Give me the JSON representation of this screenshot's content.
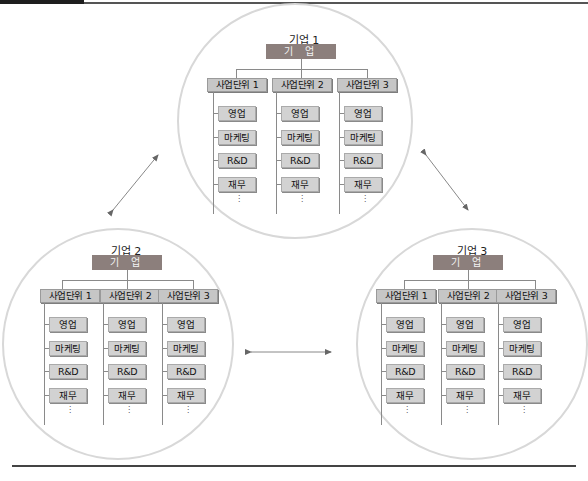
{
  "header": {
    "rule": true
  },
  "companies": [
    {
      "title": "기업 1",
      "corp_label": "기 업",
      "units": [
        {
          "label": "사업단위 1",
          "functions": [
            "영업",
            "마케팅",
            "R&D",
            "재무"
          ],
          "more": "⋮"
        },
        {
          "label": "사업단위 2",
          "functions": [
            "영업",
            "마케팅",
            "R&D",
            "재무"
          ],
          "more": "⋮"
        },
        {
          "label": "사업단위 3",
          "functions": [
            "영업",
            "마케팅",
            "R&D",
            "재무"
          ],
          "more": "⋮"
        }
      ]
    },
    {
      "title": "기업 2",
      "corp_label": "기 업",
      "units": [
        {
          "label": "사업단위 1",
          "functions": [
            "영업",
            "마케팅",
            "R&D",
            "재무"
          ],
          "more": "⋮"
        },
        {
          "label": "사업단위 2",
          "functions": [
            "영업",
            "마케팅",
            "R&D",
            "재무"
          ],
          "more": "⋮"
        },
        {
          "label": "사업단위 3",
          "functions": [
            "영업",
            "마케팅",
            "R&D",
            "재무"
          ],
          "more": "⋮"
        }
      ]
    },
    {
      "title": "기업 3",
      "corp_label": "기 업",
      "units": [
        {
          "label": "사업단위 1",
          "functions": [
            "영업",
            "마케팅",
            "R&D",
            "재무"
          ],
          "more": "⋮"
        },
        {
          "label": "사업단위 2",
          "functions": [
            "영업",
            "마케팅",
            "R&D",
            "재무"
          ],
          "more": "⋮"
        },
        {
          "label": "사업단위 3",
          "functions": [
            "영업",
            "마케팅",
            "R&D",
            "재무"
          ],
          "more": "⋮"
        }
      ]
    }
  ],
  "connections": [
    {
      "from": "기업 1",
      "to": "기업 2",
      "type": "bidirectional-arrow"
    },
    {
      "from": "기업 1",
      "to": "기업 3",
      "type": "bidirectional-arrow"
    },
    {
      "from": "기업 2",
      "to": "기업 3",
      "type": "bidirectional-arrow"
    }
  ],
  "colors": {
    "corp_box": "#8c7f7c",
    "unit_box": "#c6c6c6",
    "function_box": "#d2d2d2",
    "circle": "#d8d8d8",
    "arrow": "#777777",
    "rule": "#444444"
  }
}
